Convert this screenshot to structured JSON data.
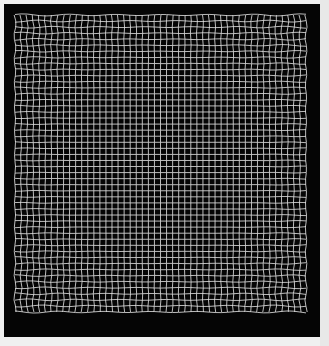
{
  "image": {
    "description": "Dense white grid of thin lines on a black square, with slight wavy distortion toward the outer edges",
    "background_color": "#f0f0f0",
    "frame_color": "#050505",
    "line_color": "#e6e6e6",
    "frame": {
      "x": 4,
      "y": 4,
      "width": 316,
      "height": 333
    },
    "grid": {
      "x": 15,
      "y": 15,
      "width": 291,
      "height": 297,
      "columns": 48,
      "rows": 49,
      "line_width": 0.9,
      "edge_wobble_px": 1.2
    }
  }
}
